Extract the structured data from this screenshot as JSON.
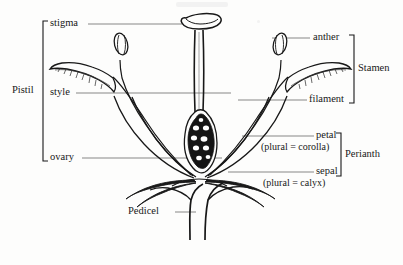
{
  "diagram": {
    "labels": {
      "stigma": "stigma",
      "style": "style",
      "ovary": "ovary",
      "anther": "anther",
      "filament": "filament",
      "petal": "petal",
      "petal_plural": "(plural  =  corolla)",
      "sepal": "sepal",
      "sepal_plural": "(plural  =  calyx)",
      "pedicel": "Pedicel"
    },
    "groups": {
      "pistil": "Pistil",
      "stamen": "Stamen",
      "perianth": "Perianth"
    },
    "colors": {
      "ink": "#181818",
      "leader": "#555555",
      "background": "#fdfdfc",
      "ovary_fill": "#151515",
      "ovule_fill": "#ffffff"
    }
  }
}
